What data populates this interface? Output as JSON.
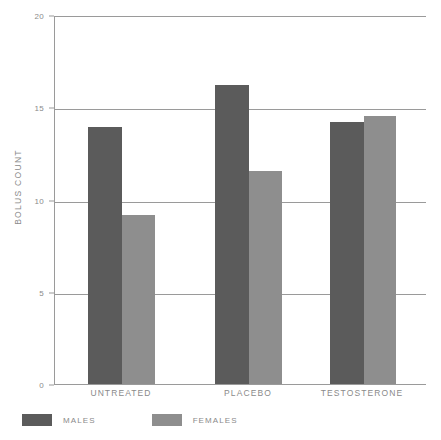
{
  "chart_data": {
    "type": "bar",
    "title": "",
    "subtitle": "",
    "xlabel": "",
    "ylabel": "BOLUS COUNT",
    "categories": [
      "UNTREATED",
      "PLACEBO",
      "TESTOSTERONE"
    ],
    "series": [
      {
        "name": "MALES",
        "color": "#5b5b5b",
        "values": [
          14.0,
          16.3,
          14.3
        ]
      },
      {
        "name": "FEMALES",
        "color": "#8e8e8e",
        "values": [
          9.2,
          11.6,
          14.6
        ]
      }
    ],
    "ylim": [
      0,
      20
    ],
    "yticks": [
      0,
      5,
      10,
      15,
      20
    ],
    "ytick_labels": [
      "0",
      "5",
      "10",
      "15",
      "20"
    ],
    "grid": true,
    "grid_axis": "y",
    "legend_position": "bottom-left",
    "legend": [
      "MALES",
      "FEMALES"
    ],
    "annotations": []
  },
  "style": {
    "background": "#ffffff",
    "axis_color": "#9a9a9a",
    "text_color": "#8a8a8a"
  }
}
